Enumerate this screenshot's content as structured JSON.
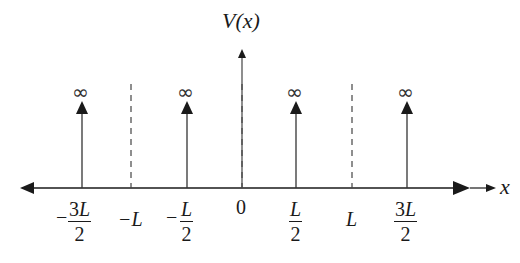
{
  "diagram": {
    "y_axis_label": "V(x)",
    "x_axis_label": "x",
    "colors": {
      "line": "#1a1a1a",
      "dashed": "#444444",
      "background": "#ffffff"
    },
    "deltas": [
      {
        "position": "-3L/2",
        "height_label": "∞"
      },
      {
        "position": "-L/2",
        "height_label": "∞"
      },
      {
        "position": "L/2",
        "height_label": "∞"
      },
      {
        "position": "3L/2",
        "height_label": "∞"
      }
    ],
    "dashed_lines": [
      "-L",
      "0",
      "L"
    ],
    "ticks": {
      "t0": {
        "sign": "−",
        "num": "3",
        "sym": "L",
        "den": "2"
      },
      "t1": {
        "text": "−L"
      },
      "t2": {
        "sign": "−",
        "num": "",
        "sym": "L",
        "den": "2"
      },
      "t3": {
        "text": "0"
      },
      "t4": {
        "num": "",
        "sym": "L",
        "den": "2"
      },
      "t5": {
        "text": "L"
      },
      "t6": {
        "num": "3",
        "sym": "L",
        "den": "2"
      }
    },
    "infinity_symbol": "∞"
  }
}
